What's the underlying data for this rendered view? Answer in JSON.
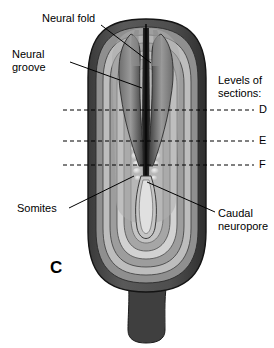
{
  "figure": {
    "panel_letter": "C",
    "caption_labels": {
      "neural_fold": "Neural fold",
      "neural_groove_line1": "Neural",
      "neural_groove_line2": "groove",
      "somites": "Somites",
      "caudal_line1": "Caudal",
      "caudal_line2": "neuropore",
      "levels_line1": "Levels of",
      "levels_line2": "sections:",
      "level_d": "D",
      "level_e": "E",
      "level_f": "F"
    },
    "colors": {
      "background": "#ffffff",
      "outline": "#000000",
      "rim_dark": "#4a4a4a",
      "band_mid": "#8c8c8c",
      "band_light": "#c9c9c9",
      "band_pale": "#e2e2e2",
      "neural_fold_dark": "#3c3c3c",
      "groove_black": "#1a1a1a",
      "somite_light": "#d6d6d6",
      "stalk": "#3f3f3f"
    },
    "section_levels": [
      {
        "label": "D",
        "y": 110
      },
      {
        "label": "E",
        "y": 141
      },
      {
        "label": "F",
        "y": 165
      }
    ],
    "structures": [
      "neural fold",
      "neural groove",
      "somites",
      "caudal neuropore",
      "connecting stalk"
    ]
  }
}
